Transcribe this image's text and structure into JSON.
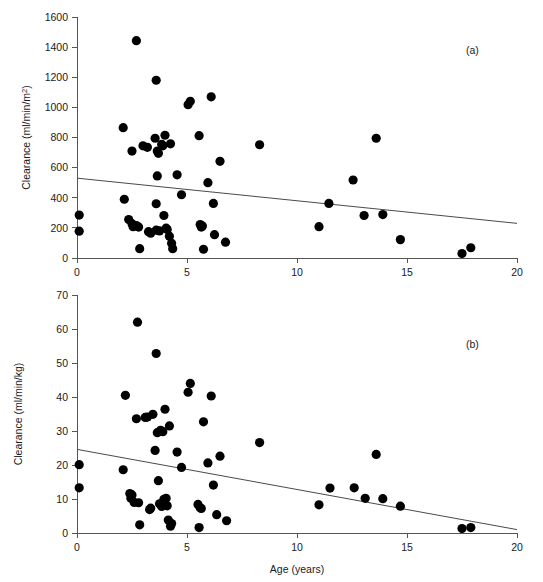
{
  "figure": {
    "background_color": "#ffffff",
    "point_color": "#000000",
    "axis_color": "#555555",
    "line_color": "#4a4a4a"
  },
  "chart_data": [
    {
      "type": "scatter",
      "panel_tag": "(a)",
      "title": "",
      "xlabel": "",
      "ylabel": "Clearance (ml/min/m²)",
      "ylabel_base": "Clearance (ml/min/m",
      "ylabel_sup": "2",
      "ylabel_tail": ")",
      "xlim": [
        0,
        20
      ],
      "ylim": [
        0,
        1600
      ],
      "xticks": [
        0,
        5,
        10,
        15,
        20
      ],
      "xtick_labels": [
        "0",
        "5",
        "10",
        "15",
        "20"
      ],
      "yticks": [
        0,
        200,
        400,
        600,
        800,
        1000,
        1200,
        1400,
        1600
      ],
      "ytick_labels": [
        "0",
        "200",
        "400",
        "600",
        "800",
        "1000",
        "1200",
        "1400",
        "1600"
      ],
      "grid": false,
      "legend": "none",
      "marker_size": 4.6,
      "trendline": {
        "x": [
          0,
          20
        ],
        "y": [
          530,
          230
        ],
        "intercept": 530,
        "slope": -15
      },
      "points": [
        {
          "x": 0.1,
          "y": 285
        },
        {
          "x": 0.1,
          "y": 178
        },
        {
          "x": 2.1,
          "y": 865
        },
        {
          "x": 2.15,
          "y": 390
        },
        {
          "x": 2.35,
          "y": 255
        },
        {
          "x": 2.5,
          "y": 710
        },
        {
          "x": 2.5,
          "y": 228
        },
        {
          "x": 2.55,
          "y": 208
        },
        {
          "x": 2.7,
          "y": 1443
        },
        {
          "x": 2.7,
          "y": 215
        },
        {
          "x": 2.8,
          "y": 205
        },
        {
          "x": 2.85,
          "y": 62
        },
        {
          "x": 3.0,
          "y": 745
        },
        {
          "x": 3.2,
          "y": 735
        },
        {
          "x": 3.25,
          "y": 175
        },
        {
          "x": 3.35,
          "y": 165
        },
        {
          "x": 3.55,
          "y": 795
        },
        {
          "x": 3.6,
          "y": 1180
        },
        {
          "x": 3.6,
          "y": 360
        },
        {
          "x": 3.6,
          "y": 185
        },
        {
          "x": 3.65,
          "y": 710
        },
        {
          "x": 3.65,
          "y": 545
        },
        {
          "x": 3.7,
          "y": 695
        },
        {
          "x": 3.75,
          "y": 180
        },
        {
          "x": 3.85,
          "y": 755
        },
        {
          "x": 3.9,
          "y": 745
        },
        {
          "x": 3.95,
          "y": 282
        },
        {
          "x": 4.0,
          "y": 815
        },
        {
          "x": 4.05,
          "y": 198
        },
        {
          "x": 4.1,
          "y": 190
        },
        {
          "x": 4.2,
          "y": 145
        },
        {
          "x": 4.25,
          "y": 758
        },
        {
          "x": 4.3,
          "y": 98
        },
        {
          "x": 4.35,
          "y": 62
        },
        {
          "x": 4.55,
          "y": 552
        },
        {
          "x": 4.75,
          "y": 420
        },
        {
          "x": 5.05,
          "y": 1018
        },
        {
          "x": 5.15,
          "y": 1040
        },
        {
          "x": 5.55,
          "y": 812
        },
        {
          "x": 5.6,
          "y": 222
        },
        {
          "x": 5.65,
          "y": 205
        },
        {
          "x": 5.7,
          "y": 212
        },
        {
          "x": 5.75,
          "y": 58
        },
        {
          "x": 5.95,
          "y": 500
        },
        {
          "x": 6.1,
          "y": 1070
        },
        {
          "x": 6.2,
          "y": 362
        },
        {
          "x": 6.25,
          "y": 155
        },
        {
          "x": 6.5,
          "y": 642
        },
        {
          "x": 6.75,
          "y": 105
        },
        {
          "x": 8.3,
          "y": 752
        },
        {
          "x": 11.0,
          "y": 208
        },
        {
          "x": 11.45,
          "y": 362
        },
        {
          "x": 12.55,
          "y": 518
        },
        {
          "x": 13.05,
          "y": 282
        },
        {
          "x": 13.6,
          "y": 795
        },
        {
          "x": 13.9,
          "y": 288
        },
        {
          "x": 14.7,
          "y": 122
        },
        {
          "x": 17.5,
          "y": 30
        },
        {
          "x": 17.9,
          "y": 68
        }
      ]
    },
    {
      "type": "scatter",
      "panel_tag": "(b)",
      "title": "",
      "xlabel": "Age (years)",
      "ylabel": "Clearance (ml/min/kg)",
      "xlim": [
        0,
        20
      ],
      "ylim": [
        0,
        70
      ],
      "xticks": [
        0,
        5,
        10,
        15,
        20
      ],
      "xtick_labels": [
        "0",
        "5",
        "10",
        "15",
        "20"
      ],
      "yticks": [
        0,
        10,
        20,
        30,
        40,
        50,
        60,
        70
      ],
      "ytick_labels": [
        "0",
        "10",
        "20",
        "30",
        "40",
        "50",
        "60",
        "70"
      ],
      "grid": false,
      "legend": "none",
      "marker_size": 4.6,
      "trendline": {
        "x": [
          0,
          20
        ],
        "y": [
          24.6,
          1.0
        ],
        "intercept": 24.6,
        "slope": -1.18
      },
      "points": [
        {
          "x": 0.1,
          "y": 20.1
        },
        {
          "x": 0.1,
          "y": 13.3
        },
        {
          "x": 2.1,
          "y": 18.6
        },
        {
          "x": 2.2,
          "y": 40.5
        },
        {
          "x": 2.4,
          "y": 11.6
        },
        {
          "x": 2.45,
          "y": 10.2
        },
        {
          "x": 2.5,
          "y": 11.2
        },
        {
          "x": 2.6,
          "y": 9.0
        },
        {
          "x": 2.7,
          "y": 33.6
        },
        {
          "x": 2.75,
          "y": 62.0
        },
        {
          "x": 2.8,
          "y": 8.9
        },
        {
          "x": 2.85,
          "y": 2.4
        },
        {
          "x": 3.1,
          "y": 34.0
        },
        {
          "x": 3.2,
          "y": 34.1
        },
        {
          "x": 3.3,
          "y": 6.9
        },
        {
          "x": 3.35,
          "y": 7.3
        },
        {
          "x": 3.45,
          "y": 34.9
        },
        {
          "x": 3.55,
          "y": 24.3
        },
        {
          "x": 3.6,
          "y": 52.8
        },
        {
          "x": 3.65,
          "y": 29.5
        },
        {
          "x": 3.7,
          "y": 15.4
        },
        {
          "x": 3.75,
          "y": 8.6
        },
        {
          "x": 3.8,
          "y": 30.2
        },
        {
          "x": 3.85,
          "y": 7.8
        },
        {
          "x": 3.9,
          "y": 29.8
        },
        {
          "x": 3.95,
          "y": 9.9
        },
        {
          "x": 4.0,
          "y": 36.4
        },
        {
          "x": 4.05,
          "y": 10.2
        },
        {
          "x": 4.1,
          "y": 8.0
        },
        {
          "x": 4.15,
          "y": 3.8
        },
        {
          "x": 4.2,
          "y": 31.5
        },
        {
          "x": 4.25,
          "y": 2.0
        },
        {
          "x": 4.3,
          "y": 2.8
        },
        {
          "x": 4.55,
          "y": 23.8
        },
        {
          "x": 4.75,
          "y": 19.3
        },
        {
          "x": 5.05,
          "y": 41.4
        },
        {
          "x": 5.15,
          "y": 44.0
        },
        {
          "x": 5.5,
          "y": 8.4
        },
        {
          "x": 5.55,
          "y": 1.6
        },
        {
          "x": 5.6,
          "y": 7.4
        },
        {
          "x": 5.65,
          "y": 7.2
        },
        {
          "x": 5.75,
          "y": 32.7
        },
        {
          "x": 5.95,
          "y": 20.6
        },
        {
          "x": 6.1,
          "y": 40.3
        },
        {
          "x": 6.2,
          "y": 14.1
        },
        {
          "x": 6.35,
          "y": 5.4
        },
        {
          "x": 6.5,
          "y": 22.6
        },
        {
          "x": 6.8,
          "y": 3.6
        },
        {
          "x": 8.3,
          "y": 26.6
        },
        {
          "x": 11.0,
          "y": 8.3
        },
        {
          "x": 11.5,
          "y": 13.2
        },
        {
          "x": 12.6,
          "y": 13.3
        },
        {
          "x": 13.1,
          "y": 10.2
        },
        {
          "x": 13.6,
          "y": 23.1
        },
        {
          "x": 13.9,
          "y": 10.1
        },
        {
          "x": 14.7,
          "y": 7.9
        },
        {
          "x": 17.5,
          "y": 1.3
        },
        {
          "x": 17.9,
          "y": 1.6
        }
      ]
    }
  ]
}
